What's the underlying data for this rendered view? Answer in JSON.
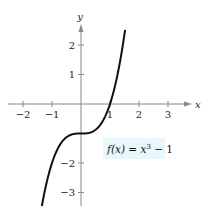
{
  "chart_data": {
    "type": "line",
    "title": "",
    "xlabel": "x",
    "ylabel": "y",
    "xlim": [
      -2.5,
      3.8
    ],
    "ylim": [
      -3.45,
      2.7
    ],
    "x_ticks": [
      -2,
      -1,
      1,
      2,
      3
    ],
    "x_tick_labels": [
      "−2",
      "−1",
      "1",
      "2",
      "3"
    ],
    "y_ticks": [
      -3,
      -2,
      1,
      2
    ],
    "y_tick_labels": [
      "−3",
      "−2",
      "1",
      "2"
    ],
    "grid": false,
    "series": [
      {
        "name": "f(x) = x^3 - 1",
        "function": "x^3 - 1",
        "x_range": [
          -1.35,
          1.52
        ],
        "color": "#111111"
      }
    ],
    "annotation": {
      "text_prefix": "f(x) = x",
      "superscript": "3",
      "text_suffix": " − 1",
      "background": "#e8f7fb",
      "placement": "lower-right of origin"
    }
  }
}
